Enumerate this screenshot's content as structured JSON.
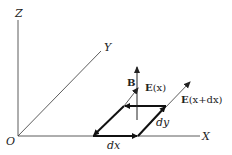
{
  "diagram": {
    "title": "",
    "axes": {
      "z_label": "Z",
      "y_label": "Y",
      "x_label": "X",
      "origin_label": "O"
    },
    "vectors": {
      "b_label": "B",
      "ex_label_bold": "E",
      "ex_label_arg": "(x)",
      "exdx_label_bold": "E",
      "exdx_label_arg": "(x+dx)"
    },
    "loop": {
      "dx_label": "dx",
      "dy_label": "dy"
    },
    "colors": {
      "line": "#333333",
      "loop": "#111111",
      "background": "#ffffff"
    }
  }
}
